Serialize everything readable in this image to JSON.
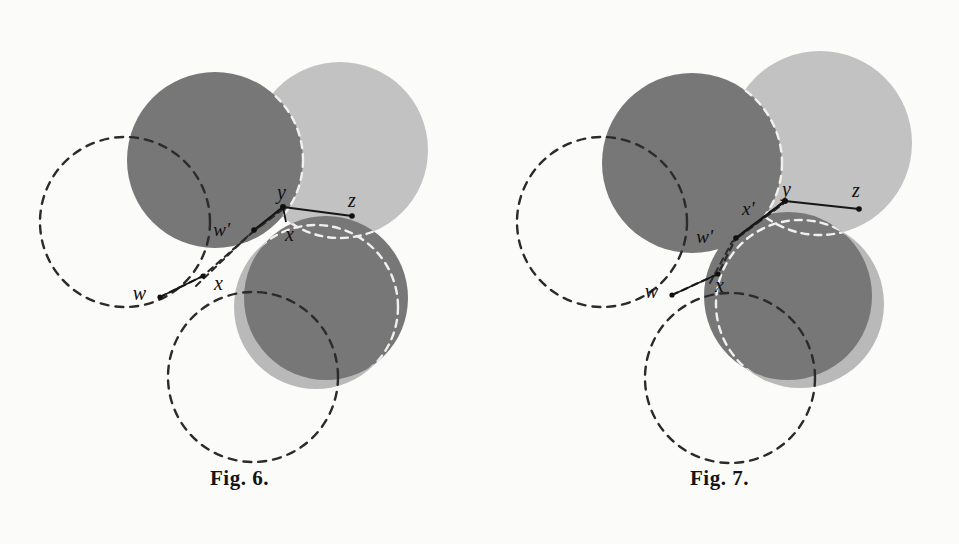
{
  "page": {
    "background_color": "#fbfbfa"
  },
  "palette": {
    "dark_disk": "#777777",
    "light_disk": "#c2c2c2",
    "shadow_disk": "#b9b9b9",
    "paper": "#fbfbfa",
    "ink": "#1a1a1a",
    "white_dash": "#f2f2f2"
  },
  "figures": [
    {
      "id": "fig6",
      "caption": "Fig. 6.",
      "disks": [
        {
          "name": "upper-left-dark-disk",
          "cx": 215,
          "cy": 160,
          "r": 88,
          "fill": "#777777"
        },
        {
          "name": "upper-right-light-disk",
          "cx": 340,
          "cy": 150,
          "r": 88,
          "fill": "#c2c2c2"
        },
        {
          "name": "lower-right-shadow-disk",
          "cx": 316,
          "cy": 305,
          "r": 82,
          "fill": "#b9b9b9"
        },
        {
          "name": "lower-right-dark-disk",
          "cx": 326,
          "cy": 298,
          "r": 82,
          "fill": "#777777"
        }
      ],
      "dashed_circles": [
        {
          "name": "left-dashed-circle",
          "cx": 125,
          "cy": 222,
          "r": 85,
          "stroke": "#2b2b2b"
        },
        {
          "name": "bottom-dashed-circle",
          "cx": 253,
          "cy": 377,
          "r": 85,
          "stroke": "#2b2b2b"
        }
      ],
      "white_dashed_arcs": [
        {
          "name": "light-disk-hidden-arc"
        },
        {
          "name": "lower-disk-hidden-arc"
        }
      ],
      "points": [
        {
          "label": "w",
          "name": "point-w",
          "px": 160,
          "py": 297,
          "lx": 150,
          "ly": 298
        },
        {
          "label": "x",
          "name": "point-x",
          "px": 202,
          "py": 277,
          "lx": 214,
          "ly": 288
        },
        {
          "label": "w'",
          "name": "point-w-prime",
          "px": 254,
          "py": 230,
          "lx": 233,
          "ly": 231
        },
        {
          "label": "x",
          "name": "point-x-inner",
          "px": 286,
          "py": 218,
          "lx": 290,
          "ly": 236
        },
        {
          "label": "y",
          "name": "point-y",
          "px": 282,
          "py": 206,
          "lx": 283,
          "ly": 196
        },
        {
          "label": "z",
          "name": "point-z",
          "px": 352,
          "py": 215,
          "lx": 354,
          "ly": 208
        }
      ],
      "segments": [
        {
          "name": "segment-w-x"
        },
        {
          "name": "segment-x-wprime"
        },
        {
          "name": "segment-wprime-y"
        },
        {
          "name": "segment-y-z"
        },
        {
          "name": "segment-y-x-inner"
        }
      ]
    },
    {
      "id": "fig7",
      "caption": "Fig. 7.",
      "disks": [
        {
          "name": "upper-left-dark-disk",
          "cx": 212,
          "cy": 163,
          "r": 90,
          "fill": "#777777"
        },
        {
          "name": "upper-right-light-disk",
          "cx": 340,
          "cy": 143,
          "r": 92,
          "fill": "#c2c2c2"
        },
        {
          "name": "lower-right-shadow-disk",
          "cx": 318,
          "cy": 302,
          "r": 84,
          "fill": "#b9b9b9"
        },
        {
          "name": "lower-right-dark-disk",
          "cx": 308,
          "cy": 296,
          "r": 84,
          "fill": "#777777"
        }
      ],
      "dashed_circles": [
        {
          "name": "left-dashed-circle",
          "cx": 122,
          "cy": 222,
          "r": 85,
          "stroke": "#2b2b2b"
        },
        {
          "name": "bottom-dashed-circle",
          "cx": 250,
          "cy": 378,
          "r": 85,
          "stroke": "#2b2b2b"
        }
      ],
      "white_dashed_arcs": [
        {
          "name": "light-disk-hidden-arc"
        },
        {
          "name": "lower-disk-hidden-arc"
        }
      ],
      "points": [
        {
          "label": "w",
          "name": "point-w",
          "px": 192,
          "py": 295,
          "lx": 179,
          "ly": 296
        },
        {
          "label": "x",
          "name": "point-x",
          "px": 238,
          "py": 275,
          "lx": 238,
          "ly": 288
        },
        {
          "label": "w'",
          "name": "point-w-prime",
          "px": 256,
          "py": 238,
          "lx": 236,
          "ly": 234
        },
        {
          "label": "x'",
          "name": "point-x-prime",
          "px": 285,
          "py": 214,
          "lx": 271,
          "ly": 209
        },
        {
          "label": "y",
          "name": "point-y",
          "px": 305,
          "py": 200,
          "lx": 308,
          "ly": 196
        },
        {
          "label": "z",
          "name": "point-z",
          "px": 379,
          "py": 208,
          "lx": 376,
          "ly": 195
        }
      ],
      "segments": [
        {
          "name": "segment-w-x"
        },
        {
          "name": "segment-x-wprime"
        },
        {
          "name": "segment-wprime-y"
        },
        {
          "name": "segment-y-z"
        }
      ]
    }
  ]
}
